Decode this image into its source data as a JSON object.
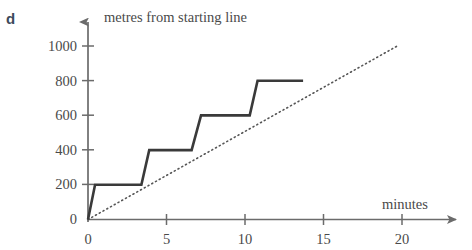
{
  "part_label": "d",
  "colors": {
    "axis": "#6b6b6b",
    "text": "#4a4a4a",
    "series_line": "#3a3a3a",
    "reference_line": "#555555",
    "part_label": "#3d4a5c",
    "background": "#ffffff"
  },
  "chart_data": {
    "type": "line",
    "title": "",
    "xlabel": "minutes",
    "ylabel": "metres from starting line",
    "xlim": [
      0,
      24
    ],
    "ylim": [
      0,
      1100
    ],
    "xticks": [
      0,
      5,
      10,
      15,
      20
    ],
    "xtick_labels": [
      "0",
      "5",
      "10",
      "15",
      "20"
    ],
    "yticks": [
      0,
      200,
      400,
      600,
      800,
      1000
    ],
    "ytick_labels": [
      "0",
      "200",
      "400",
      "600",
      "800",
      "1000"
    ],
    "grid": false,
    "legend": "none",
    "series": [
      {
        "name": "step-journey",
        "style": "solid",
        "x": [
          0,
          0.45,
          3.4,
          3.9,
          6.6,
          7.2,
          10.3,
          10.8,
          13.7
        ],
        "y": [
          0,
          200,
          200,
          400,
          400,
          600,
          600,
          800,
          800
        ]
      },
      {
        "name": "average-rate",
        "style": "dotted",
        "x": [
          0,
          19.7
        ],
        "y": [
          0,
          1000
        ]
      }
    ]
  }
}
